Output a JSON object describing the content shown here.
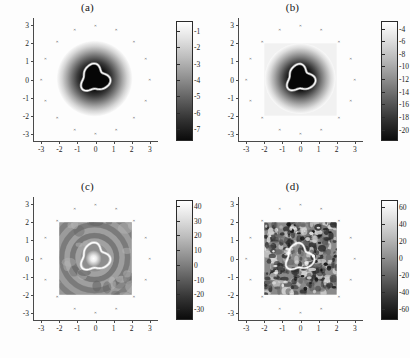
{
  "figure": {
    "caption_style": "four-panel-grayscale-reconstruction",
    "background": "#fdfdfd"
  },
  "chart_data": [
    {
      "type": "heatmap",
      "panel": "a",
      "title": "(a)",
      "xlabel": "",
      "ylabel": "",
      "xlim": [
        -3.4,
        3.4
      ],
      "ylim": [
        -3.4,
        3.4
      ],
      "xticks": [
        -3,
        -2,
        -1,
        0,
        1,
        2,
        3
      ],
      "yticks": [
        -3,
        -2,
        -1,
        0,
        1,
        2,
        3
      ],
      "xticklabels": [
        "-3",
        "-2",
        "-1",
        "0",
        "1",
        "2",
        "3"
      ],
      "yticklabels": [
        "-3",
        "-2",
        "-1",
        "0",
        "1",
        "2",
        "3"
      ],
      "grid": false,
      "colormap": "gray",
      "colorbar": {
        "position": "right",
        "ticks": [
          -1,
          -2,
          -3,
          -4,
          -5,
          -6,
          -7
        ],
        "ticklabels": [
          "-1",
          "-2",
          "-3",
          "-4",
          "-5",
          "-6",
          "-7"
        ],
        "vmin": -7.6,
        "vmax": -0.4,
        "orientation": "vertical"
      },
      "field": "smooth-gaussian-well",
      "contour_level": -6.0,
      "blob_center": [
        -0.05,
        0.05
      ],
      "blob_radius": 0.72,
      "halo_radius": 1.55,
      "region": null,
      "sensor_ring": {
        "radius": 3.0,
        "count": 16
      }
    },
    {
      "type": "heatmap",
      "panel": "b",
      "title": "(b)",
      "xlabel": "",
      "ylabel": "",
      "xlim": [
        -3.4,
        3.4
      ],
      "ylim": [
        -3.4,
        3.4
      ],
      "xticks": [
        -3,
        -2,
        -1,
        0,
        1,
        2,
        3
      ],
      "yticks": [
        -3,
        -2,
        -1,
        0,
        1,
        2,
        3
      ],
      "xticklabels": [
        "-3",
        "-2",
        "-1",
        "0",
        "1",
        "2",
        "3"
      ],
      "yticklabels": [
        "-3",
        "-2",
        "-1",
        "0",
        "1",
        "2",
        "3"
      ],
      "grid": false,
      "colormap": "gray",
      "colorbar": {
        "position": "right",
        "ticks": [
          -4,
          -6,
          -8,
          -10,
          -12,
          -14,
          -16,
          -18,
          -20
        ],
        "ticklabels": [
          "-4",
          "-6",
          "-8",
          "-10",
          "-12",
          "-14",
          "-16",
          "-18",
          "-20"
        ],
        "vmin": -21.5,
        "vmax": -2.8,
        "orientation": "vertical"
      },
      "field": "smooth-gaussian-well-with-square-support",
      "contour_level": -17.0,
      "blob_center": [
        -0.02,
        0.05
      ],
      "blob_radius": 0.7,
      "halo_radius": 1.45,
      "region": {
        "xmin": -2.0,
        "xmax": 2.0,
        "ymin": -2.0,
        "ymax": 2.0,
        "shade": "light"
      },
      "sensor_ring": {
        "radius": 3.0,
        "count": 16
      }
    },
    {
      "type": "heatmap",
      "panel": "c",
      "title": "(c)",
      "xlabel": "",
      "ylabel": "",
      "xlim": [
        -3.4,
        3.4
      ],
      "ylim": [
        -3.4,
        3.4
      ],
      "xticks": [
        -3,
        -2,
        -1,
        0,
        1,
        2,
        3
      ],
      "yticks": [
        -3,
        -2,
        -1,
        0,
        1,
        2,
        3
      ],
      "xticklabels": [
        "-3",
        "-2",
        "-1",
        "0",
        "1",
        "2",
        "3"
      ],
      "yticklabels": [
        "-3",
        "-2",
        "-1",
        "0",
        "1",
        "2",
        "3"
      ],
      "grid": false,
      "colormap": "gray",
      "colorbar": {
        "position": "right",
        "ticks": [
          40,
          30,
          20,
          10,
          0,
          -10,
          -20,
          -30
        ],
        "ticklabels": [
          "40",
          "30",
          "20",
          "10",
          "0",
          "-10",
          "-20",
          "-30"
        ],
        "vmin": -36,
        "vmax": 44,
        "orientation": "vertical"
      },
      "field": "concentric-ripples-bright-core",
      "contour_level": 8.0,
      "blob_center": [
        -0.05,
        0.05
      ],
      "blob_radius": 0.72,
      "halo_radius": 0.4,
      "region": {
        "xmin": -2.0,
        "xmax": 2.0,
        "ymin": -2.0,
        "ymax": 2.0,
        "shade": "mid"
      },
      "sensor_ring": {
        "radius": 3.0,
        "count": 16
      }
    },
    {
      "type": "heatmap",
      "panel": "d",
      "title": "(d)",
      "xlabel": "",
      "ylabel": "",
      "xlim": [
        -3.4,
        3.4
      ],
      "ylim": [
        -3.4,
        3.4
      ],
      "xticks": [
        -3,
        -2,
        -1,
        0,
        1,
        2,
        3
      ],
      "yticks": [
        -3,
        -2,
        -1,
        0,
        1,
        2,
        3
      ],
      "xticklabels": [
        "-3",
        "-2",
        "-1",
        "0",
        "1",
        "2",
        "3"
      ],
      "yticklabels": [
        "-3",
        "-2",
        "-1",
        "0",
        "1",
        "2",
        "3"
      ],
      "grid": false,
      "colormap": "gray",
      "colorbar": {
        "position": "right",
        "ticks": [
          60,
          40,
          20,
          0,
          -20,
          -40,
          -60
        ],
        "ticklabels": [
          "60",
          "40",
          "20",
          "0",
          "-20",
          "-40",
          "-60"
        ],
        "vmin": -70,
        "vmax": 68,
        "orientation": "vertical"
      },
      "field": "high-frequency-speckle",
      "contour_level": 15.0,
      "blob_center": [
        -0.08,
        0.05
      ],
      "blob_radius": 0.7,
      "halo_radius": 0.0,
      "region": {
        "xmin": -2.0,
        "xmax": 2.0,
        "ymin": -2.0,
        "ymax": 2.0,
        "shade": "mid"
      },
      "sensor_ring": {
        "radius": 3.0,
        "count": 16
      }
    }
  ]
}
